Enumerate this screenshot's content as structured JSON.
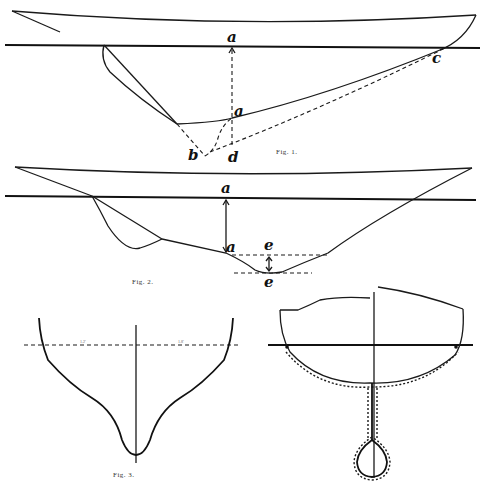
{
  "figures": [
    {
      "id": "fig1",
      "caption": "Fig. 1.",
      "labels": {
        "a_top": "a",
        "a_mid": "a",
        "b": "b",
        "c": "c",
        "d": "d"
      }
    },
    {
      "id": "fig2",
      "caption": "Fig. 2.",
      "labels": {
        "a_top": "a",
        "a_bottom": "a",
        "e_top": "e",
        "e_bottom": "e"
      }
    },
    {
      "id": "fig3",
      "caption": "Fig. 3.",
      "labels": {
        "waterline_left": "1.2'",
        "waterline_right": "1.8'"
      }
    },
    {
      "id": "fig4",
      "caption": "",
      "labels": {}
    }
  ],
  "colors": {
    "ink": "#1a1a1a",
    "paper": "#ffffff"
  }
}
